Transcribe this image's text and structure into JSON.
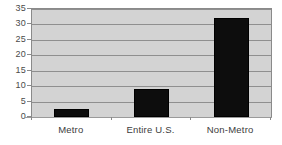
{
  "chart_data": {
    "type": "bar",
    "title": "",
    "subtitle": "",
    "xlabel": "",
    "ylabel": "",
    "categories": [
      "Metro",
      "Entire U.S.",
      "Non-Metro"
    ],
    "values": [
      2.5,
      9,
      32
    ],
    "ylim": [
      0,
      35
    ],
    "yticks": [
      0,
      5,
      10,
      15,
      20,
      25,
      30,
      35
    ],
    "ytick_labels": [
      "0",
      "5",
      "10",
      "15",
      "20",
      "25",
      "30",
      "35"
    ],
    "grid": true,
    "legend": false,
    "legend_position": "none",
    "annotations": [],
    "colors": {
      "bar": "#0d0d0d",
      "plot_background": "#d3d3d3",
      "gridline": "#8f8f8f",
      "axis": "#8a8a8a",
      "tick_label": "#4a4a4a",
      "category_label": "#3c3c3c",
      "page_background": "#ffffff"
    }
  }
}
